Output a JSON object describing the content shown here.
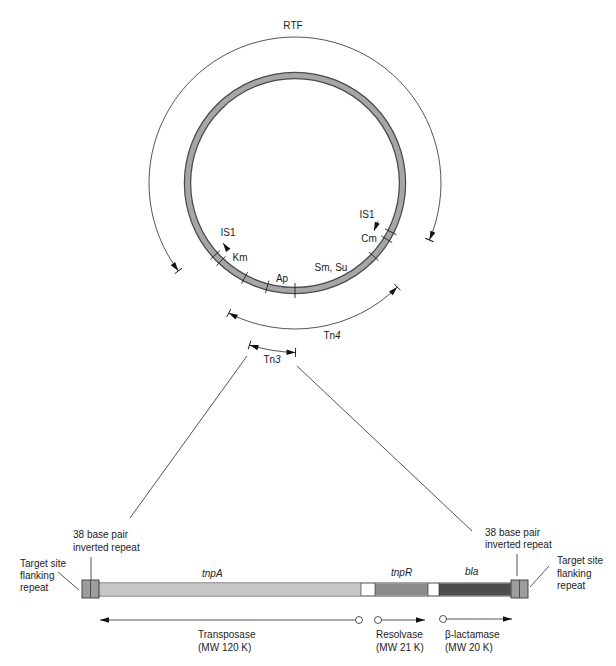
{
  "plasmid": {
    "label": "RTF",
    "markers": {
      "is1_left": "IS1",
      "km": "Km",
      "ap": "Ap",
      "sm_su": "Sm, Su",
      "is1_right": "IS1",
      "cm": "Cm"
    }
  },
  "transposons": {
    "tn4": {
      "prefix": "Tn",
      "number": "4"
    },
    "tn3": {
      "prefix": "Tn",
      "number": "3"
    }
  },
  "tn3_map": {
    "left": {
      "inverted_repeat": [
        "38 base pair",
        "inverted repeat"
      ],
      "flanking_repeat": [
        "Target site",
        "flanking",
        "repeat"
      ]
    },
    "right": {
      "inverted_repeat": [
        "38 base pair",
        "inverted repeat"
      ],
      "flanking_repeat": [
        "Target site",
        "flanking",
        "repeat"
      ]
    },
    "genes": [
      {
        "name": "tnpA",
        "color": "#c6c6c6",
        "product": "Transposase",
        "mw": "(MW 120 K)"
      },
      {
        "name": "tnpR",
        "color": "#8c8c8c",
        "product": "Resolvase",
        "mw": "(MW 21 K)"
      },
      {
        "name": "bla",
        "color": "#4d4d4d",
        "product": "β-lactamase",
        "mw": "(MW 20 K)"
      }
    ],
    "repeat_color": "#9d9d9d"
  },
  "colors": {
    "ring_fill": "#a6a6a6",
    "ring_edge": "#4a4a4a",
    "line": "#2a2a2a"
  }
}
